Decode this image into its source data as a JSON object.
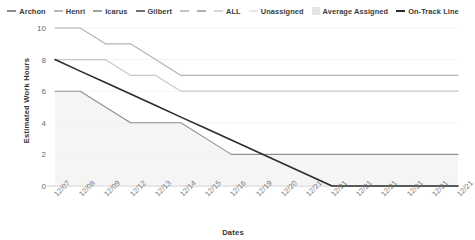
{
  "chart_data": {
    "type": "line",
    "title": "",
    "xlabel": "Dates",
    "ylabel": "Estimated Work Hours",
    "ylim": [
      0,
      10
    ],
    "yticks": [
      0,
      2,
      4,
      6,
      8,
      10
    ],
    "grid": false,
    "legend_position": "top",
    "categories": [
      "12/07",
      "12/08",
      "12/09",
      "12/12",
      "12/13",
      "12/14",
      "12/15",
      "12/16",
      "12/19",
      "12/20",
      "12/21",
      "12/21",
      "12/21",
      "12/21",
      "12/21",
      "12/21",
      "12/21"
    ],
    "series": [
      {
        "name": "Archon",
        "color": "#b4b4b4",
        "values": [
          10,
          10,
          9,
          9,
          8,
          7,
          7,
          7,
          7,
          7,
          7,
          7,
          7,
          7,
          7,
          7,
          7
        ]
      },
      {
        "name": "Henri",
        "color": "#c8c8c8",
        "values": [
          8,
          8,
          8,
          7,
          7,
          6,
          6,
          6,
          6,
          6,
          6,
          6,
          6,
          6,
          6,
          6,
          6
        ]
      },
      {
        "name": "Icarus",
        "color": "#d2d2d2",
        "values": [
          null,
          null,
          null,
          null,
          null,
          null,
          null,
          null,
          null,
          null,
          null,
          null,
          null,
          null,
          null,
          null,
          null
        ]
      },
      {
        "name": "Gilbert",
        "color": "#9b9b9b",
        "values": [
          null,
          null,
          null,
          null,
          null,
          null,
          null,
          null,
          null,
          null,
          null,
          null,
          null,
          null,
          null,
          null,
          null
        ]
      },
      {
        "name": "ALL",
        "color": "#cfcfcf",
        "values": [
          null,
          null,
          null,
          null,
          null,
          null,
          null,
          null,
          null,
          null,
          null,
          null,
          null,
          null,
          null,
          null,
          null
        ]
      },
      {
        "name": "Unassigned",
        "color": "#dcdcdc",
        "values": [
          null,
          null,
          null,
          null,
          null,
          null,
          null,
          null,
          null,
          null,
          null,
          null,
          null,
          null,
          null,
          null,
          null
        ]
      },
      {
        "name": "Average Assigned",
        "color": "#ededed",
        "area": true,
        "values": [
          6,
          6,
          5,
          4,
          4,
          4,
          3,
          2,
          2,
          2,
          2,
          2,
          2,
          2,
          2,
          2,
          2
        ]
      },
      {
        "name": "On-Track Line",
        "color": "#2b2b2b",
        "values": [
          8,
          7.27,
          6.55,
          5.82,
          5.09,
          4.36,
          3.64,
          2.91,
          2.18,
          1.45,
          0.73,
          0,
          0,
          0,
          0,
          0,
          0
        ]
      }
    ],
    "legend": [
      {
        "label": "Archon",
        "marker": "dash",
        "color": "#8c8c8c"
      },
      {
        "label": "Henri",
        "marker": "dash",
        "color": "#b9b9b9"
      },
      {
        "label": "Icarus",
        "marker": "dash",
        "color": "#a0a0a0"
      },
      {
        "label": "Gilbert",
        "marker": "dash",
        "color": "#707070"
      },
      {
        "label": "",
        "marker": "dash",
        "color": "#c4c4c4"
      },
      {
        "label": "",
        "marker": "dash",
        "color": "#b0b0b0"
      },
      {
        "label": "ALL",
        "marker": "dash",
        "color": "#d8d8d8"
      },
      {
        "label": "Unassigned",
        "marker": "dash",
        "color": "#e6e6e6"
      },
      {
        "label": "Average Assigned",
        "marker": "box",
        "color": "#e4e4e4"
      },
      {
        "label": "On-Track Line",
        "marker": "dash",
        "color": "#2b2b2b"
      }
    ]
  },
  "axis": {
    "ylabel": "Estimated Work Hours",
    "xlabel": "Dates"
  }
}
